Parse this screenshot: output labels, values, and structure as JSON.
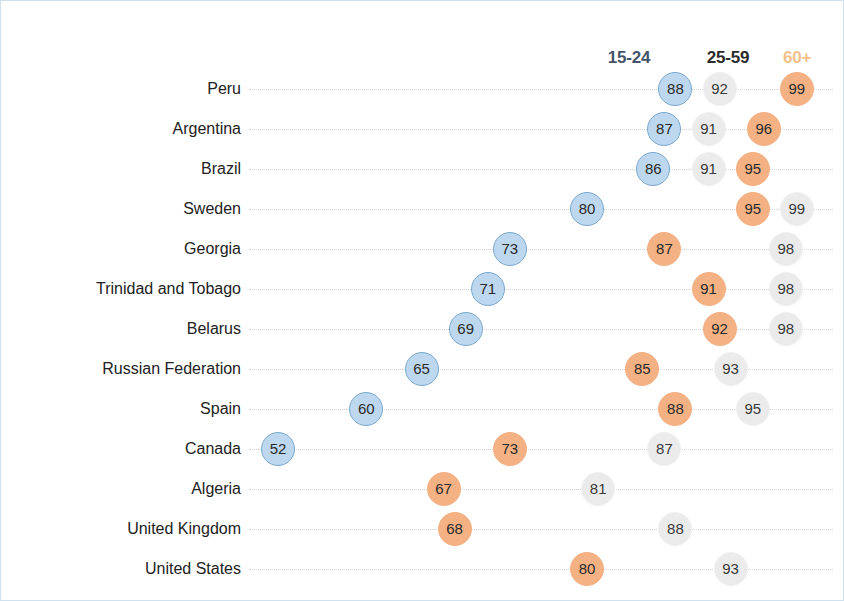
{
  "chart_data": {
    "type": "scatter",
    "title": "",
    "subtitle": "",
    "xlabel": "",
    "ylabel": "",
    "xlim": [
      50,
      101
    ],
    "grid": true,
    "legend_position": "top-right",
    "categories": [
      "Peru",
      "Argentina",
      "Brazil",
      "Sweden",
      "Georgia",
      "Trinidad and Tobago",
      "Belarus",
      "Russian Federation",
      "Spain",
      "Canada",
      "Algeria",
      "United Kingdom",
      "United States"
    ],
    "series": [
      {
        "name": "15-24",
        "color": "#bdd7ee",
        "values": [
          88,
          87,
          86,
          80,
          73,
          71,
          69,
          65,
          60,
          52,
          null,
          null,
          null
        ]
      },
      {
        "name": "25-59",
        "color": "#ebebeb",
        "values": [
          92,
          91,
          91,
          99,
          98,
          98,
          98,
          93,
          95,
          87,
          81,
          88,
          93
        ]
      },
      {
        "name": "60+",
        "color": "#f4b183",
        "values": [
          99,
          96,
          95,
          95,
          87,
          91,
          92,
          85,
          88,
          73,
          67,
          68,
          80
        ]
      }
    ]
  },
  "legend": {
    "items": [
      {
        "label": "15-24",
        "color": "#44546a",
        "css": "legend-1524",
        "x": 628
      },
      {
        "label": "25-59",
        "color": "#2b2b2b",
        "css": "legend-2559",
        "x": 727
      },
      {
        "label": "60+",
        "color": "#f2c08a",
        "css": "legend-60",
        "x": 796
      }
    ]
  },
  "rows": [
    {
      "label": "Peru",
      "y": 88,
      "dots": [
        {
          "v": 88,
          "c": "blue"
        },
        {
          "v": 92,
          "c": "gray"
        },
        {
          "v": 99,
          "c": "orange"
        }
      ]
    },
    {
      "label": "Argentina",
      "y": 128,
      "dots": [
        {
          "v": 87,
          "c": "blue"
        },
        {
          "v": 91,
          "c": "gray"
        },
        {
          "v": 96,
          "c": "orange"
        }
      ]
    },
    {
      "label": "Brazil",
      "y": 168,
      "dots": [
        {
          "v": 86,
          "c": "blue"
        },
        {
          "v": 91,
          "c": "gray"
        },
        {
          "v": 95,
          "c": "orange"
        }
      ]
    },
    {
      "label": "Sweden",
      "y": 208,
      "dots": [
        {
          "v": 80,
          "c": "blue"
        },
        {
          "v": 99,
          "c": "gray"
        },
        {
          "v": 95,
          "c": "orange"
        }
      ]
    },
    {
      "label": "Georgia",
      "y": 248,
      "dots": [
        {
          "v": 73,
          "c": "blue"
        },
        {
          "v": 98,
          "c": "gray"
        },
        {
          "v": 87,
          "c": "orange"
        }
      ]
    },
    {
      "label": "Trinidad and Tobago",
      "y": 288,
      "dots": [
        {
          "v": 71,
          "c": "blue"
        },
        {
          "v": 98,
          "c": "gray"
        },
        {
          "v": 91,
          "c": "orange"
        }
      ]
    },
    {
      "label": "Belarus",
      "y": 328,
      "dots": [
        {
          "v": 69,
          "c": "blue"
        },
        {
          "v": 98,
          "c": "gray"
        },
        {
          "v": 92,
          "c": "orange"
        }
      ]
    },
    {
      "label": "Russian Federation",
      "y": 368,
      "dots": [
        {
          "v": 65,
          "c": "blue"
        },
        {
          "v": 93,
          "c": "gray"
        },
        {
          "v": 85,
          "c": "orange"
        }
      ]
    },
    {
      "label": "Spain",
      "y": 408,
      "dots": [
        {
          "v": 60,
          "c": "blue"
        },
        {
          "v": 95,
          "c": "gray"
        },
        {
          "v": 88,
          "c": "orange"
        }
      ]
    },
    {
      "label": "Canada",
      "y": 448,
      "dots": [
        {
          "v": 52,
          "c": "blue"
        },
        {
          "v": 87,
          "c": "gray"
        },
        {
          "v": 73,
          "c": "orange"
        }
      ]
    },
    {
      "label": "Algeria",
      "y": 488,
      "dots": [
        {
          "v": 81,
          "c": "gray"
        },
        {
          "v": 67,
          "c": "orange"
        }
      ]
    },
    {
      "label": "United Kingdom",
      "y": 528,
      "dots": [
        {
          "v": 88,
          "c": "gray"
        },
        {
          "v": 68,
          "c": "orange"
        }
      ]
    },
    {
      "label": "United States",
      "y": 568,
      "dots": [
        {
          "v": 93,
          "c": "gray"
        },
        {
          "v": 80,
          "c": "orange"
        }
      ]
    }
  ],
  "scale": {
    "x0_value": 52,
    "x0_px": 277,
    "px_per_unit": 11.04
  }
}
